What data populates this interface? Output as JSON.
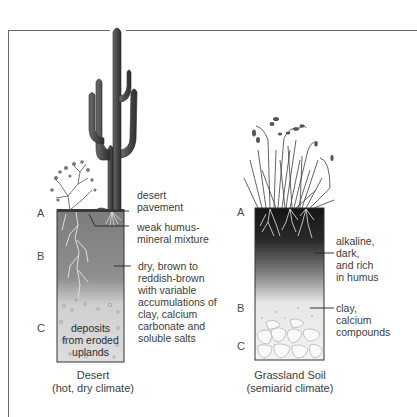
{
  "figure": {
    "type": "soil-profile-comparison",
    "profiles": [
      {
        "name": "desert",
        "caption_title": "Desert",
        "caption_subtitle": "(hot, dry climate)",
        "horizons": [
          "A",
          "B",
          "C"
        ],
        "inside_text": [
          "deposits",
          "from eroded",
          "uplands"
        ],
        "annotations": [
          {
            "text": [
              "desert",
              "pavement"
            ]
          },
          {
            "text": [
              "weak humus-",
              "mineral mixture"
            ]
          },
          {
            "text": [
              "dry, brown to",
              "reddish-brown",
              "with variable",
              "accumulations of",
              "clay, calcium",
              "carbonate and",
              "soluble salts"
            ]
          }
        ],
        "vegetation": [
          "saguaro-cactus",
          "desert-shrub"
        ]
      },
      {
        "name": "grassland",
        "caption_title": "Grassland Soil",
        "caption_subtitle": "(semiarid climate)",
        "horizons": [
          "A",
          "B",
          "C"
        ],
        "annotations": [
          {
            "text": [
              "alkaline,",
              "dark,",
              "and rich",
              "in humus"
            ]
          },
          {
            "text": [
              "clay,",
              "calcium",
              "compounds"
            ]
          }
        ],
        "vegetation": [
          "grass-tuft"
        ]
      }
    ]
  },
  "colors": {
    "frame": "#6b6b6b",
    "desert_soil_top": "#7a7a7a",
    "desert_soil_bottom": "#d8d8d8",
    "grass_soil_top": "#1a1a1a",
    "grass_soil_bottom": "#f0f0f0",
    "text": "#3c3c3c"
  }
}
